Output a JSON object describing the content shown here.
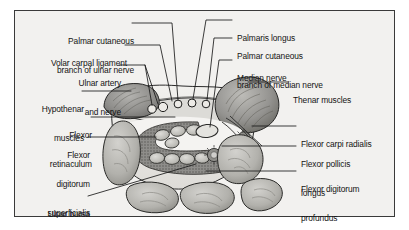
{
  "figure": {
    "type": "anatomical-cross-section",
    "region": "carpal tunnel (wrist)",
    "frame_color": "#3a3a3a",
    "background_color": "#f2f1ef"
  },
  "labels_left": [
    {
      "id": "palmar-cutaneous-ulnar",
      "lines": [
        "Palmar cutaneous",
        "branch of ulnar nerve"
      ]
    },
    {
      "id": "volar-carpal-ligament",
      "lines": [
        "Volar carpal ligament"
      ]
    },
    {
      "id": "ulnar-artery-and-nerve",
      "lines": [
        "Ulnar artery",
        "and nerve"
      ]
    },
    {
      "id": "hypothenar-muscles",
      "lines": [
        "Hypothenar",
        "muscles"
      ]
    },
    {
      "id": "flexor-retinaculum",
      "lines": [
        "Flexor",
        "retinaculum"
      ]
    },
    {
      "id": "flexor-digitorum-superficialis",
      "lines": [
        "Flexor",
        "digitorum",
        "superficialis"
      ]
    },
    {
      "id": "ulnar-bursa",
      "lines": [
        "Ulnar bursa"
      ]
    }
  ],
  "labels_right": [
    {
      "id": "palmaris-longus",
      "lines": [
        "Palmaris longus"
      ]
    },
    {
      "id": "palmar-cutaneous-median",
      "lines": [
        "Palmar cutaneous",
        "branch of median nerve"
      ]
    },
    {
      "id": "median-nerve",
      "lines": [
        "Median nerve"
      ]
    },
    {
      "id": "thenar-muscles",
      "lines": [
        "Thenar muscles"
      ]
    },
    {
      "id": "flexor-carpi-radialis",
      "lines": [
        "Flexor carpi radialis"
      ]
    },
    {
      "id": "flexor-pollicis-longus",
      "lines": [
        "Flexor pollicis",
        "longus"
      ]
    },
    {
      "id": "flexor-digitorum-profundus",
      "lines": [
        "Flexor digitorum",
        "profundus"
      ]
    }
  ],
  "colors": {
    "leader_line": "#1a1a1a",
    "outline": "#2b2b2b",
    "muscle_fill": "#9a9a98",
    "muscle_dark": "#6f6f6d",
    "bone_fill": "#b9b8b4",
    "tendon_fill": "#c6c5c1",
    "bursa_fill": "#8b8a87",
    "skin_fill": "#e8e7e4",
    "tunnel_fill": "#f4f3f1"
  }
}
